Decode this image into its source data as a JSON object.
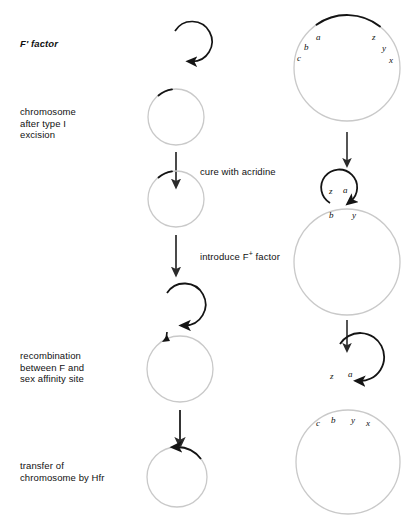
{
  "figure": {
    "colors": {
      "dark_stroke": "#141414",
      "light_stroke": "#c9c9c9",
      "arrow": "#2b2b2b",
      "text": "#111111",
      "background": "#ffffff"
    }
  },
  "left_labels": [
    {
      "id": "f-prime-factor",
      "text": "F' factor",
      "style": "italic"
    },
    {
      "id": "chromosome-after-type-i-excision",
      "text": "chromosome\nafter type I\nexcision",
      "style": "plain"
    },
    {
      "id": "recombination-between-f-and-sex-affinity-site",
      "text": "recombination\nbetween F and\nsex affinity site",
      "style": "plain"
    },
    {
      "id": "transfer-of-chromosome-by-hfr",
      "text": "transfer of\nchromosome by Hfr",
      "style": "plain"
    }
  ],
  "step_annotations": [
    {
      "id": "cure-with-acridine",
      "text": "cure with acridine"
    },
    {
      "id": "introduce-f-plus-factor",
      "text": "introduce F",
      "sup": "+",
      "suffix": " factor"
    }
  ],
  "annotation_plain": {
    "cure": "cure with acridine",
    "introduce_prefix": "introduce F",
    "introduce_sup": "+",
    "introduce_suffix": " factor"
  },
  "middle_column": {
    "f_prime_circle": {
      "name": "f-prime-factor-circle",
      "cx": 175,
      "cy": 51,
      "r": 20,
      "stroke": "dark"
    },
    "chromosome_circle": {
      "name": "chromosome-circle-type-i",
      "cx": 176,
      "cy": 117,
      "r": 28,
      "stroke": "light",
      "dark_arc": true
    },
    "cured_circle": {
      "name": "cured-chromosome-circle",
      "cx": 176,
      "cy": 199,
      "r": 28,
      "stroke": "light",
      "dark_arc": true
    },
    "recomb_small_circle": {
      "name": "f-plus-factor-circle",
      "cx": 167,
      "cy": 314,
      "r": 21,
      "stroke": "dark"
    },
    "recomb_large_circle": {
      "name": "recombination-chromosome-circle",
      "cx": 180,
      "cy": 369,
      "r": 33,
      "stroke": "light"
    },
    "hfr_circle": {
      "name": "hfr-chromosome-circle",
      "cx": 177,
      "cy": 477,
      "r": 30,
      "stroke": "light",
      "dark_arc": true
    }
  },
  "right_column": {
    "top_circle": {
      "name": "hfr-chromosome-with-genes",
      "cx": 347,
      "cy": 68,
      "r": 53,
      "genes_left": [
        "a",
        "b",
        "c"
      ],
      "genes_right": [
        "z",
        "y",
        "x"
      ]
    },
    "excision_figure": {
      "name": "f-prime-excision-figure",
      "small_circle": {
        "cx": 338,
        "cy": 187,
        "r": 18
      },
      "large_circle": {
        "cx": 347,
        "cy": 262,
        "r": 53
      },
      "genes_in_loop": [
        "z",
        "a"
      ],
      "genes_on_chromosome": [
        "b",
        "y"
      ]
    },
    "bottom_figure": {
      "name": "separated-f-prime-and-chromosome",
      "small_circle": {
        "cx": 340,
        "cy": 368,
        "r": 24
      },
      "large_circle": {
        "cx": 348,
        "cy": 462,
        "r": 52
      },
      "genes_small": [
        "z",
        "a"
      ],
      "genes_large": [
        "c",
        "b",
        "y",
        "x"
      ]
    }
  },
  "arrows": {
    "middle": [
      {
        "name": "arrow-cure-with-acridine",
        "x": 176,
        "y1": 152,
        "y2": 184
      },
      {
        "name": "arrow-introduce-f-plus",
        "x": 176,
        "y1": 235,
        "y2": 272
      },
      {
        "name": "arrow-to-hfr-transfer",
        "x": 180,
        "y1": 410,
        "y2": 443
      }
    ],
    "right": [
      {
        "name": "arrow-right-excision",
        "x": 347,
        "y1": 132,
        "y2": 163
      },
      {
        "name": "arrow-right-separation",
        "x": 347,
        "y1": 320,
        "y2": 348
      }
    ]
  }
}
